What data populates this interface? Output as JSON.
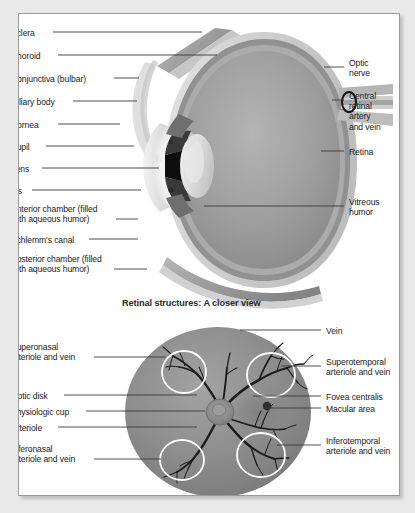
{
  "figure": {
    "section_heading": "Retinal structures: A closer view",
    "eye_cross_section": {
      "name": "eye-cross-section-diagram",
      "labels_left": [
        {
          "text": "Sclera",
          "x": 10,
          "y": 27,
          "line": {
            "x1": 52,
            "y1": 31,
            "x2": 201,
            "y2": 31
          }
        },
        {
          "text": "Choroid",
          "x": 10,
          "y": 50,
          "line": {
            "x1": 57,
            "y1": 54,
            "x2": 216,
            "y2": 54
          }
        },
        {
          "text": "Conjunctiva (bulbar)",
          "x": 10,
          "y": 73,
          "line": {
            "x1": 113,
            "y1": 77,
            "x2": 138,
            "y2": 77
          }
        },
        {
          "text": "Ciliary body",
          "x": 10,
          "y": 96,
          "line": {
            "x1": 72,
            "y1": 100,
            "x2": 136,
            "y2": 100
          }
        },
        {
          "text": "Cornea",
          "x": 10,
          "y": 119,
          "line": {
            "x1": 57,
            "y1": 123,
            "x2": 119,
            "y2": 123
          }
        },
        {
          "text": "Pupil",
          "x": 10,
          "y": 141,
          "line": {
            "x1": 45,
            "y1": 145,
            "x2": 133,
            "y2": 145
          }
        },
        {
          "text": "Lens",
          "x": 10,
          "y": 163,
          "line": {
            "x1": 41,
            "y1": 167,
            "x2": 158,
            "y2": 167
          }
        },
        {
          "text": "Iris",
          "x": 10,
          "y": 185,
          "line": {
            "x1": 31,
            "y1": 189,
            "x2": 140,
            "y2": 189
          }
        },
        {
          "text": "Anterior chamber (filled\nwith aqueous humor)",
          "x": 10,
          "y": 203,
          "line": {
            "x1": 115,
            "y1": 218,
            "x2": 137,
            "y2": 218
          }
        },
        {
          "text": "Schlemm's canal",
          "x": 10,
          "y": 234,
          "line": {
            "x1": 88,
            "y1": 238,
            "x2": 137,
            "y2": 238
          }
        },
        {
          "text": "Posterior chamber (filled\nwith aqueous humor)",
          "x": 10,
          "y": 253,
          "line": {
            "x1": 113,
            "y1": 268,
            "x2": 146,
            "y2": 268
          }
        }
      ],
      "labels_right": [
        {
          "text": "Optic\nnerve",
          "x": 348,
          "y": 57,
          "line": {
            "x1": 323,
            "y1": 66,
            "x2": 343,
            "y2": 66
          }
        },
        {
          "text": "Central\nretinal\nartery\nand vein",
          "x": 348,
          "y": 90,
          "line": {
            "x1": 331,
            "y1": 99,
            "x2": 343,
            "y2": 99
          }
        },
        {
          "text": "Retina",
          "x": 348,
          "y": 146,
          "line": {
            "x1": 320,
            "y1": 150,
            "x2": 343,
            "y2": 150
          }
        },
        {
          "text": "Vitreous\nhumor",
          "x": 348,
          "y": 196,
          "line": {
            "x1": 203,
            "y1": 205,
            "x2": 343,
            "y2": 205
          }
        }
      ]
    },
    "retina_fundus": {
      "name": "retinal-fundus-diagram",
      "labels_left": [
        {
          "text": "Superonasal\narteriole and vein",
          "x": 10,
          "y": 341,
          "line": {
            "x1": 93,
            "y1": 356,
            "x2": 165,
            "y2": 356
          }
        },
        {
          "text": "Optic disk",
          "x": 10,
          "y": 390,
          "line": {
            "x1": 63,
            "y1": 394,
            "x2": 196,
            "y2": 394
          }
        },
        {
          "text": "Physiologic cup",
          "x": 10,
          "y": 406,
          "line": {
            "x1": 85,
            "y1": 410,
            "x2": 204,
            "y2": 410
          }
        },
        {
          "text": "Arteriole",
          "x": 10,
          "y": 422,
          "line": {
            "x1": 57,
            "y1": 426,
            "x2": 196,
            "y2": 426
          }
        },
        {
          "text": "Inferonasal\narteriole and vein",
          "x": 10,
          "y": 443,
          "line": {
            "x1": 93,
            "y1": 458,
            "x2": 160,
            "y2": 458
          }
        }
      ],
      "labels_right": [
        {
          "text": "Vein",
          "x": 325,
          "y": 325,
          "line": {
            "x1": 239,
            "y1": 329,
            "x2": 320,
            "y2": 329
          }
        },
        {
          "text": "Superotemporal\narteriole and vein",
          "x": 325,
          "y": 356,
          "line": {
            "x1": 280,
            "y1": 365,
            "x2": 320,
            "y2": 365
          }
        },
        {
          "text": "Fovea centralis",
          "x": 325,
          "y": 391,
          "line": {
            "x1": 252,
            "y1": 395,
            "x2": 320,
            "y2": 395
          }
        },
        {
          "text": "Macular area",
          "x": 325,
          "y": 403,
          "line": {
            "x1": 262,
            "y1": 407,
            "x2": 320,
            "y2": 407
          }
        },
        {
          "text": "Inferotemporal\narteriole and vein",
          "x": 325,
          "y": 435,
          "line": {
            "x1": 276,
            "y1": 444,
            "x2": 320,
            "y2": 444
          }
        }
      ]
    }
  },
  "colors": {
    "page_background": "#e9e9e9",
    "panel_background": "#ffffff",
    "panel_border": "#9a9a9a",
    "label_text": "#1b1b1b",
    "leader_line": "#3a3a3a",
    "sclera": "#c9c9c9",
    "choroid": "#8f8f8f",
    "retina_layer": "#a8a8a8",
    "vitreous": "#9e9e9e",
    "lens": "#d8d8d8",
    "pupil": "#111111",
    "fundus_disc": "#8c8c8c",
    "fundus_vessel": "#1e1e1e",
    "highlight_ring": "#ffffff"
  }
}
